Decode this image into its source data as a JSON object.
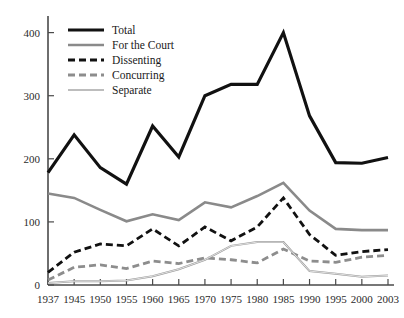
{
  "chart_data": {
    "type": "line",
    "title": "",
    "subtitle": "",
    "xlabel": "",
    "ylabel": "",
    "x": [
      1937,
      1945,
      1950,
      1955,
      1960,
      1965,
      1970,
      1975,
      1980,
      1985,
      1990,
      1995,
      2000,
      2003
    ],
    "categories": [
      "1937",
      "1945",
      "1950",
      "1955",
      "1960",
      "1965",
      "1970",
      "1975",
      "1980",
      "1985",
      "1990",
      "1995",
      "2000",
      "2003"
    ],
    "xlim": [
      1937,
      2003
    ],
    "ylim": [
      0,
      420
    ],
    "yticks": [
      0,
      100,
      200,
      300,
      400
    ],
    "ytick_labels": [
      "0",
      "100",
      "200",
      "300",
      "400"
    ],
    "grid": false,
    "legend_position": "top-left",
    "series": [
      {
        "name": "Total",
        "color": "#111111",
        "style": "solid",
        "width": 3.2,
        "values": [
          178,
          238,
          186,
          160,
          252,
          203,
          300,
          318,
          318,
          400,
          268,
          194,
          193,
          202
        ]
      },
      {
        "name": "For the Court",
        "color": "#8a8a8a",
        "style": "solid",
        "width": 2.6,
        "values": [
          145,
          138,
          119,
          101,
          112,
          103,
          131,
          123,
          141,
          162,
          118,
          89,
          87,
          87
        ]
      },
      {
        "name": "Dissenting",
        "color": "#111111",
        "style": "dashed",
        "width": 2.8,
        "values": [
          20,
          52,
          65,
          62,
          89,
          62,
          92,
          70,
          92,
          138,
          80,
          47,
          53,
          56
        ]
      },
      {
        "name": "Concurring",
        "color": "#8d8d8d",
        "style": "dashed",
        "width": 2.8,
        "values": [
          8,
          28,
          32,
          26,
          38,
          34,
          43,
          40,
          35,
          57,
          38,
          36,
          44,
          47
        ]
      },
      {
        "name": "Separate",
        "color": "#9a9a9a",
        "style": "solid",
        "width": 2.0,
        "values": [
          3,
          6,
          6,
          7,
          14,
          25,
          40,
          62,
          68,
          68,
          22,
          18,
          13,
          15
        ]
      }
    ]
  },
  "legend": {
    "items": [
      {
        "label": "Total"
      },
      {
        "label": "For the Court"
      },
      {
        "label": "Dissenting"
      },
      {
        "label": "Concurring"
      },
      {
        "label": "Separate"
      }
    ]
  }
}
